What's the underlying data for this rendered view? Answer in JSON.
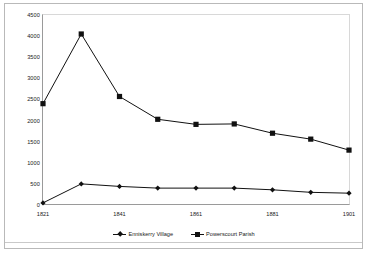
{
  "chart_data": {
    "type": "line",
    "title": "",
    "subtitle": "",
    "xlabel": "",
    "ylabel": "",
    "x": [
      1821,
      1831,
      1841,
      1851,
      1861,
      1871,
      1881,
      1891,
      1901
    ],
    "xtick_labels": [
      "1821",
      "1841",
      "1861",
      "1881",
      "1901"
    ],
    "xtick_values": [
      1821,
      1841,
      1861,
      1881,
      1901
    ],
    "ytick_labels": [
      "0",
      "500",
      "1000",
      "1500",
      "2000",
      "2500",
      "3000",
      "3500",
      "4000",
      "4500"
    ],
    "ytick_values": [
      0,
      500,
      1000,
      1500,
      2000,
      2500,
      3000,
      3500,
      4000,
      4500
    ],
    "ylim": [
      0,
      4500
    ],
    "xlim": [
      1821,
      1901
    ],
    "grid": false,
    "legend_position": "bottom",
    "series": [
      {
        "name": "Enniskerry Village",
        "marker": "diamond",
        "color": "#111111",
        "values": [
          50,
          500,
          440,
          400,
          400,
          400,
          360,
          300,
          280
        ]
      },
      {
        "name": "Powerscourt Parish",
        "marker": "square",
        "color": "#111111",
        "values": [
          2400,
          4050,
          2570,
          2030,
          1910,
          1920,
          1700,
          1560,
          1300
        ]
      }
    ]
  },
  "legend": {
    "entries": [
      {
        "label": "Enniskerry Village"
      },
      {
        "label": "Powerscourt Parish"
      }
    ]
  },
  "axes": {
    "y_axis_name": "population-axis",
    "x_axis_name": "year-axis"
  }
}
